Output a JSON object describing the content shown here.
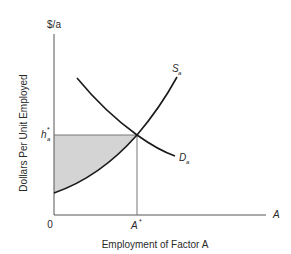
{
  "figure": {
    "y_axis_unit": "$/a",
    "y_axis_label": "Dollars Per Unit Employed",
    "x_axis_label": "Employment of Factor A",
    "x_axis_symbol": "A",
    "origin_label": "0",
    "equilibrium_quantity_label": "A",
    "equilibrium_quantity_sup": "*",
    "equilibrium_price_label": "h",
    "equilibrium_price_sub": "a",
    "equilibrium_price_sup": "*",
    "supply_curve_label": "S",
    "supply_curve_sub": "a",
    "demand_curve_label": "D",
    "demand_curve_sub": "a"
  },
  "colors": {
    "axis": "#555555",
    "curve": "#1a1a1a",
    "shaded_area": "#d4d4d4",
    "guide_line": "#777777"
  }
}
